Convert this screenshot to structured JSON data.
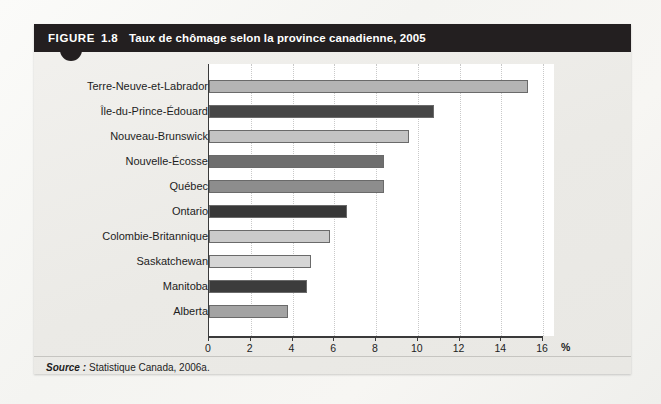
{
  "figure": {
    "label": "FIGURE",
    "number": "1.8",
    "title": "Taux de chômage selon la province canadienne, 2005"
  },
  "source": {
    "word": "Source :",
    "text": "Statistique Canada, 2006a."
  },
  "colors": {
    "header_background": "#231f20",
    "card_background": "#eeedea",
    "plot_background": "#ffffff",
    "axis": "#3a3a3a",
    "gridline": "#c9c9c9"
  },
  "chart_data": {
    "type": "bar",
    "orientation": "horizontal",
    "title": "Taux de chômage selon la province canadienne, 2005",
    "xlabel": "%",
    "ylabel": "",
    "xlim": [
      0,
      16
    ],
    "xticks": [
      0,
      2,
      4,
      6,
      8,
      10,
      12,
      14,
      16
    ],
    "xtick_labels": [
      "0",
      "2",
      "4",
      "6",
      "8",
      "10",
      "12",
      "14",
      "16"
    ],
    "grid": true,
    "legend": "none",
    "unit_suffix": "%",
    "categories": [
      "Terre-Neuve-et-Labrador",
      "Île-du-Prince-Édouard",
      "Nouveau-Brunswick",
      "Nouvelle-Écosse",
      "Québec",
      "Ontario",
      "Colombie-Britannique",
      "Saskatchewan",
      "Manitoba",
      "Alberta"
    ],
    "values": [
      15.3,
      10.8,
      9.6,
      8.4,
      8.4,
      6.6,
      5.8,
      4.9,
      4.7,
      3.8
    ],
    "bar_colors": [
      "#b4b4b4",
      "#464646",
      "#c3c3c3",
      "#6e6e6e",
      "#8d8d8d",
      "#383838",
      "#cacaca",
      "#d6d6d6",
      "#3c3c3c",
      "#a3a3a3"
    ]
  }
}
